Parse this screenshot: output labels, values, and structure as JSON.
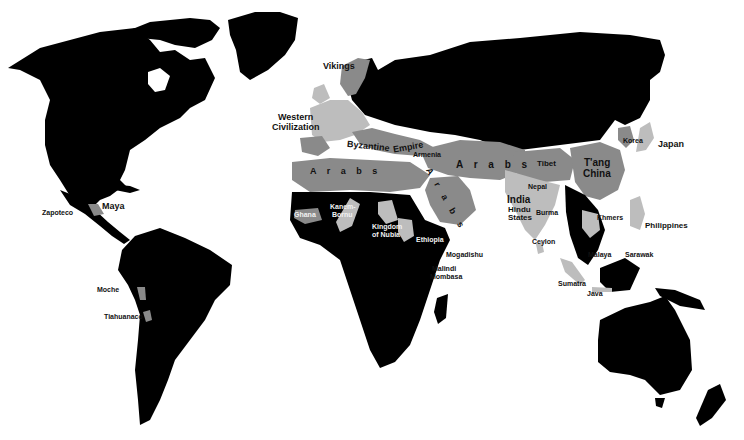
{
  "map": {
    "type": "historical world map",
    "colors": {
      "background": "#ffffff",
      "other_lands": "#000000",
      "civilization_dark": "#8a8a8a",
      "civilization_light": "#bdbdbd"
    },
    "labels": {
      "vikings": "Vikings",
      "western_civ_1": "Western",
      "western_civ_2": "Civilization",
      "byzantine": "Byzantine",
      "empire": "Empire",
      "armenia": "Armenia",
      "arabs_africa": "A r a b s",
      "arabs_mideast": "A r a b s",
      "arabs_arabia": "A r a b s",
      "tibet": "Tibet",
      "tang_1": "T'ang",
      "tang_2": "China",
      "korea": "Korea",
      "japan": "Japan",
      "nepal": "Nepal",
      "india": "India",
      "hindu_1": "Hindu",
      "hindu_2": "States",
      "burma": "Burma",
      "ceylon": "Ceylon",
      "khmers": "Khmers",
      "philippines": "Philippines",
      "malaya": "Malaya",
      "sarawak": "Sarawak",
      "sumatra": "Sumatra",
      "java": "Java",
      "ghana": "Ghana",
      "kanem_1": "Kanem-",
      "kanem_2": "Bornu",
      "nubia_1": "Kingdom",
      "nubia_2": "of Nubia",
      "ethiopia": "Ethiopia",
      "mogadishu": "Mogadishu",
      "malindi": "Malindi",
      "mombasa": "Mombasa",
      "zapoteco": "Zapoteco",
      "maya": "Maya",
      "moche": "Moche",
      "tiahuanaco": "Tiahuanaco"
    }
  }
}
